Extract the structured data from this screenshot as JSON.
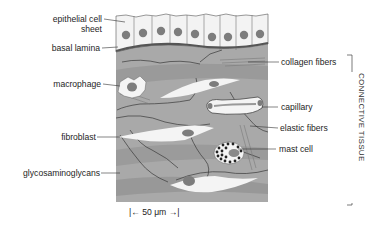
{
  "figure": {
    "type": "histology-illustration"
  },
  "labels_left": [
    {
      "id": "epithelial",
      "line1": "epithelial cell",
      "line2": "sheet"
    },
    {
      "id": "basal",
      "text": "basal lamina"
    },
    {
      "id": "macrophage",
      "text": "macrophage"
    },
    {
      "id": "fibroblast",
      "text": "fibroblast"
    },
    {
      "id": "gag",
      "text": "glycosaminoglycans"
    }
  ],
  "labels_right": [
    {
      "id": "collagen",
      "text": "collagen fibers"
    },
    {
      "id": "capillary",
      "text": "capillary"
    },
    {
      "id": "elastic",
      "text": "elastic fibers"
    },
    {
      "id": "mast",
      "text": "mast cell"
    }
  ],
  "bracket_label": "CONNECTIVE TISSUE",
  "scale_bar": {
    "text": "|← 50 μm →|",
    "value": "50 μm"
  },
  "colors": {
    "matrix": "#a9a9a9",
    "matrix_dark": "#8e8e8e",
    "cell_white": "#f4f4f4",
    "nucleus": "#7d7d7d",
    "basal_lamina": "#5a5a5a",
    "line": "#2a2a2a"
  }
}
